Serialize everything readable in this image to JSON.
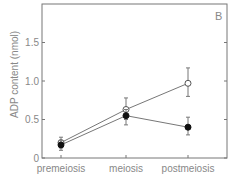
{
  "chart_data": {
    "type": "line",
    "panel_label": "B",
    "title": "",
    "xlabel": "",
    "ylabel": "ADP content (nmol)",
    "categories": [
      "premeiosis",
      "meiosis",
      "postmeiosis"
    ],
    "y_ticks": [
      "0",
      "0.5",
      "1.0",
      "1.5"
    ],
    "ylim": [
      0,
      2.0
    ],
    "grid": false,
    "legend": "none",
    "series": [
      {
        "name": "open circles",
        "marker": "open-circle",
        "values": [
          0.2,
          0.63,
          0.97
        ],
        "err_low": [
          0.13,
          0.5,
          0.8
        ],
        "err_high": [
          0.27,
          0.78,
          1.17
        ]
      },
      {
        "name": "filled circles",
        "marker": "filled-circle",
        "values": [
          0.17,
          0.55,
          0.4
        ],
        "err_low": [
          0.1,
          0.43,
          0.3
        ],
        "err_high": [
          0.23,
          0.63,
          0.53
        ]
      }
    ]
  }
}
